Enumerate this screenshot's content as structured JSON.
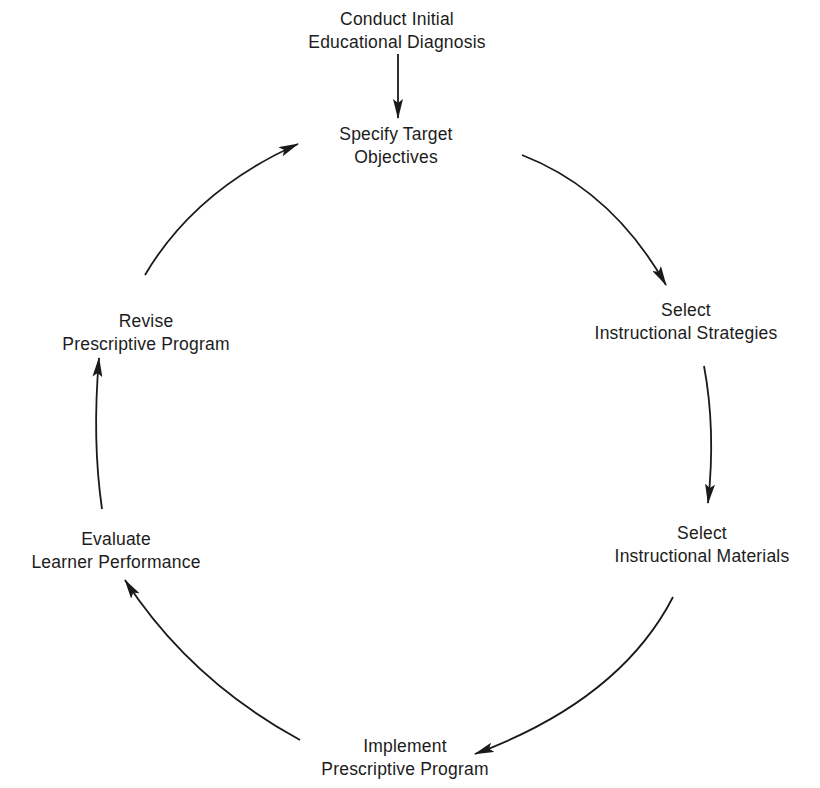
{
  "diagram": {
    "type": "cycle",
    "entry_node": {
      "id": "conduct-diagnosis",
      "lines": [
        "Conduct Initial",
        "Educational Diagnosis"
      ]
    },
    "nodes": [
      {
        "id": "specify-objectives",
        "lines": [
          "Specify Target",
          "Objectives"
        ]
      },
      {
        "id": "select-strategies",
        "lines": [
          "Select",
          "Instructional Strategies"
        ]
      },
      {
        "id": "select-materials",
        "lines": [
          "Select",
          "Instructional Materials"
        ]
      },
      {
        "id": "implement-program",
        "lines": [
          "Implement",
          "Prescriptive Program"
        ]
      },
      {
        "id": "evaluate-performance",
        "lines": [
          "Evaluate",
          "Learner Performance"
        ]
      },
      {
        "id": "revise-program",
        "lines": [
          "Revise",
          "Prescriptive Program"
        ]
      }
    ],
    "edges": [
      {
        "from": "conduct-diagnosis",
        "to": "specify-objectives"
      },
      {
        "from": "specify-objectives",
        "to": "select-strategies"
      },
      {
        "from": "select-strategies",
        "to": "select-materials"
      },
      {
        "from": "select-materials",
        "to": "implement-program"
      },
      {
        "from": "implement-program",
        "to": "evaluate-performance"
      },
      {
        "from": "evaluate-performance",
        "to": "revise-program"
      },
      {
        "from": "revise-program",
        "to": "specify-objectives"
      }
    ],
    "colors": {
      "background": "#ffffff",
      "ink": "#1a1a1a"
    }
  }
}
